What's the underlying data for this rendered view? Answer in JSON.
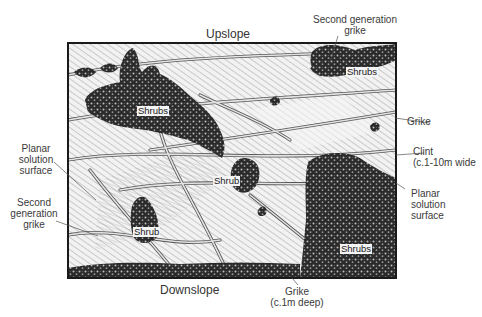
{
  "diagram": {
    "type": "limestone pavement sketch",
    "orientation": {
      "top": "Upslope",
      "bottom": "Downslope"
    },
    "inner_labels": [
      {
        "id": "shrubs-upper-left",
        "text": "Shrubs"
      },
      {
        "id": "shrubs-upper-right",
        "text": "Shrubs"
      },
      {
        "id": "shrub-center",
        "text": "Shrub"
      },
      {
        "id": "shrub-lower-left",
        "text": "Shrub"
      },
      {
        "id": "shrubs-lower-right",
        "text": "Shrubs"
      }
    ],
    "callouts": {
      "second_gen_grike_top": [
        "Second generation",
        "grike"
      ],
      "grike_right": "Grike",
      "clint": [
        "Clint",
        "(c.1-10m wide"
      ],
      "planar_right": [
        "Planar",
        "solution",
        "surface"
      ],
      "planar_left": [
        "Planar",
        "solution",
        "surface"
      ],
      "second_gen_grike_left": [
        "Second",
        "generation",
        "grike"
      ],
      "grike_bottom": [
        "Grike",
        "(c.1m deep)"
      ]
    },
    "colors": {
      "frame": "#1a1a1a",
      "shrub_fill": "#2b2b2b",
      "hatch": "#555555",
      "grike_fill": "#cfcfcf",
      "background": "#ffffff"
    }
  }
}
